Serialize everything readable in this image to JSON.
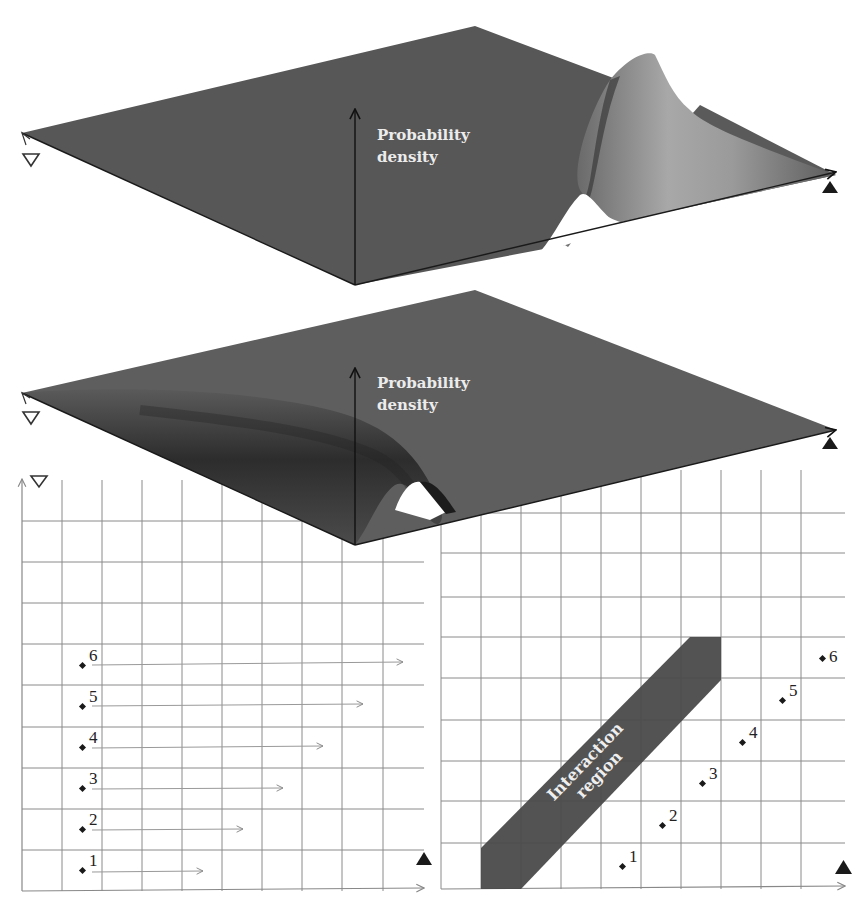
{
  "colors": {
    "surface": "#5a5a5a",
    "surface_dark": "#2e2e2e",
    "surface_light": "#9a9a9a",
    "grid": "#8a8a8a",
    "band": "#4a4a4a",
    "ink": "#1e1e1e",
    "background": "#ffffff"
  },
  "top_surface": {
    "axis_label_line1": "Probability",
    "axis_label_line2": "density",
    "left_marker": "open-triangle-down",
    "right_marker": "filled-triangle-up",
    "feature": "single sharp ridge near right axis"
  },
  "middle_surface": {
    "axis_label_line1": "Probability",
    "axis_label_line2": "density",
    "left_marker": "open-triangle-down",
    "right_marker": "filled-triangle-up",
    "feature": "broad trough along left axis"
  },
  "left_grid": {
    "corner_marker": "open-triangle-down",
    "axis_marker": "filled-triangle-up",
    "points": [
      {
        "label": "1",
        "arrow_length_cells": 3
      },
      {
        "label": "2",
        "arrow_length_cells": 4
      },
      {
        "label": "3",
        "arrow_length_cells": 5
      },
      {
        "label": "4",
        "arrow_length_cells": 6
      },
      {
        "label": "5",
        "arrow_length_cells": 7
      },
      {
        "label": "6",
        "arrow_length_cells": 8
      }
    ]
  },
  "right_grid": {
    "axis_marker": "filled-triangle-up",
    "band_label_line1": "Interaction",
    "band_label_line2": "region",
    "points": [
      {
        "label": "1"
      },
      {
        "label": "2"
      },
      {
        "label": "3"
      },
      {
        "label": "4"
      },
      {
        "label": "5"
      },
      {
        "label": "6"
      }
    ]
  }
}
